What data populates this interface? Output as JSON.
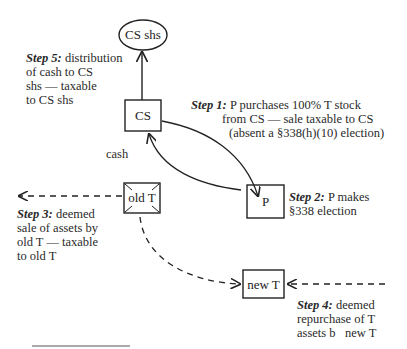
{
  "nodes": {
    "cs_shs": "CS shs",
    "cs": "CS",
    "p": "P",
    "old_t": "old T",
    "new_t": "new T"
  },
  "edges": {
    "cash": "cash"
  },
  "steps": [
    {
      "label": "Step 1:",
      "text": "P purchases 100% T stock",
      "line2": "from CS — sale taxable to CS",
      "line3": "(absent a §338(h)(10) election)"
    },
    {
      "label": "Step 2:",
      "text": "P makes",
      "line2": "§338 election"
    },
    {
      "label": "Step 3:",
      "text": "deemed",
      "line2": "sale of assets by",
      "line3": "old T — taxable",
      "line4": "to old T"
    },
    {
      "label": "Step 4:",
      "text": "deemed",
      "line2": "repurchase of T",
      "line3": "assets b   new T"
    },
    {
      "label": "Step 5:",
      "text": "distribution",
      "line2": "of cash to CS",
      "line3": "shs — taxable",
      "line4": "to CS shs"
    }
  ],
  "colors": {
    "ink": "#222222",
    "background": "#ffffff"
  }
}
